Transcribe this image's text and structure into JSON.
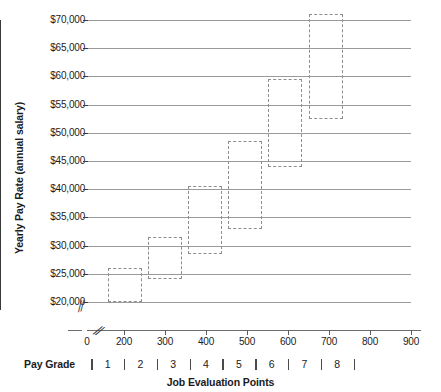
{
  "chart_data": {
    "type": "bar",
    "title": "",
    "subtitle": "",
    "xlabel": "Job Evaluation Points",
    "ylabel": "Yearly Pay Rate (annual salary)",
    "secondary_xlabel": "Pay Grade",
    "xlim": [
      0,
      950
    ],
    "ylim": [
      20000,
      70000
    ],
    "y_axis_broken": true,
    "x_axis_broken": true,
    "grid": true,
    "legend": null,
    "y_tick_labels": [
      "$70,000",
      "$65,000",
      "$60,000",
      "$55,000",
      "$50,000",
      "$45,000",
      "$40,000",
      "$35,000",
      "$30,000",
      "$25,000",
      "$20,000"
    ],
    "y_tick_values": [
      70000,
      65000,
      60000,
      55000,
      50000,
      45000,
      40000,
      35000,
      30000,
      25000,
      20000
    ],
    "x_tick_labels": [
      "0",
      "200",
      "300",
      "400",
      "500",
      "600",
      "700",
      "800",
      "900"
    ],
    "x_tick_values": [
      0,
      200,
      300,
      400,
      500,
      600,
      700,
      800,
      900
    ],
    "pay_grade_labels": [
      "1",
      "2",
      "3",
      "4",
      "5",
      "6",
      "7",
      "8"
    ],
    "pay_grade_boundaries": [
      120,
      200,
      280,
      360,
      440,
      520,
      600,
      680,
      760
    ],
    "series": [
      {
        "name": "Pay range by grade",
        "style": "dashed-open-rectangle",
        "color": "#8d8d8d",
        "boxes": [
          {
            "grade": "1",
            "x_start": 160,
            "x_end": 243,
            "pay_min": 20000,
            "pay_max": 26000
          },
          {
            "grade": "2",
            "x_start": 258,
            "x_end": 341,
            "pay_min": 24000,
            "pay_max": 31500
          },
          {
            "grade": "3",
            "x_start": 356,
            "x_end": 439,
            "pay_min": 28500,
            "pay_max": 40500
          },
          {
            "grade": "4",
            "x_start": 454,
            "x_end": 537,
            "pay_min": 33000,
            "pay_max": 48500
          },
          {
            "grade": "5",
            "x_start": 552,
            "x_end": 635,
            "pay_min": 44000,
            "pay_max": 59500
          },
          {
            "grade": "6",
            "x_start": 650,
            "x_end": 733,
            "pay_min": 52500,
            "pay_max": 71000
          }
        ]
      }
    ]
  }
}
